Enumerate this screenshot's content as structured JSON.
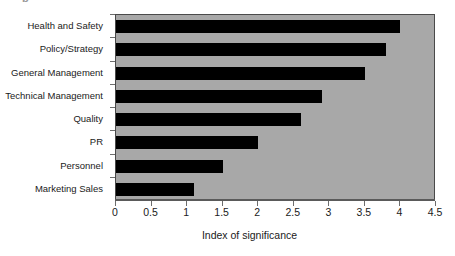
{
  "figure": {
    "top_crumb": "p",
    "background_color": "#ffffff",
    "plot_background_color": "#a8a8a8",
    "bar_color": "#000000",
    "axis_color": "#5a5a5a"
  },
  "chart_data": {
    "type": "bar",
    "orientation": "horizontal",
    "title": "",
    "xlabel": "Index of significance",
    "ylabel": "",
    "categories": [
      "Health and Safety",
      "Policy/Strategy",
      "General Management",
      "Technical Management",
      "Quality",
      "PR",
      "Personnel",
      "Marketing Sales"
    ],
    "values": [
      4.0,
      3.8,
      3.5,
      2.9,
      2.6,
      2.0,
      1.5,
      1.1
    ],
    "xlim": [
      0,
      4.5
    ],
    "xticks": [
      0,
      0.5,
      1,
      1.5,
      2,
      2.5,
      3,
      3.5,
      4,
      4.5
    ],
    "xticklabels": [
      "0",
      "0.5",
      "1",
      "1.5",
      "2",
      "2.5",
      "3",
      "3.5",
      "4",
      "4.5"
    ],
    "grid": false,
    "legend": null
  }
}
